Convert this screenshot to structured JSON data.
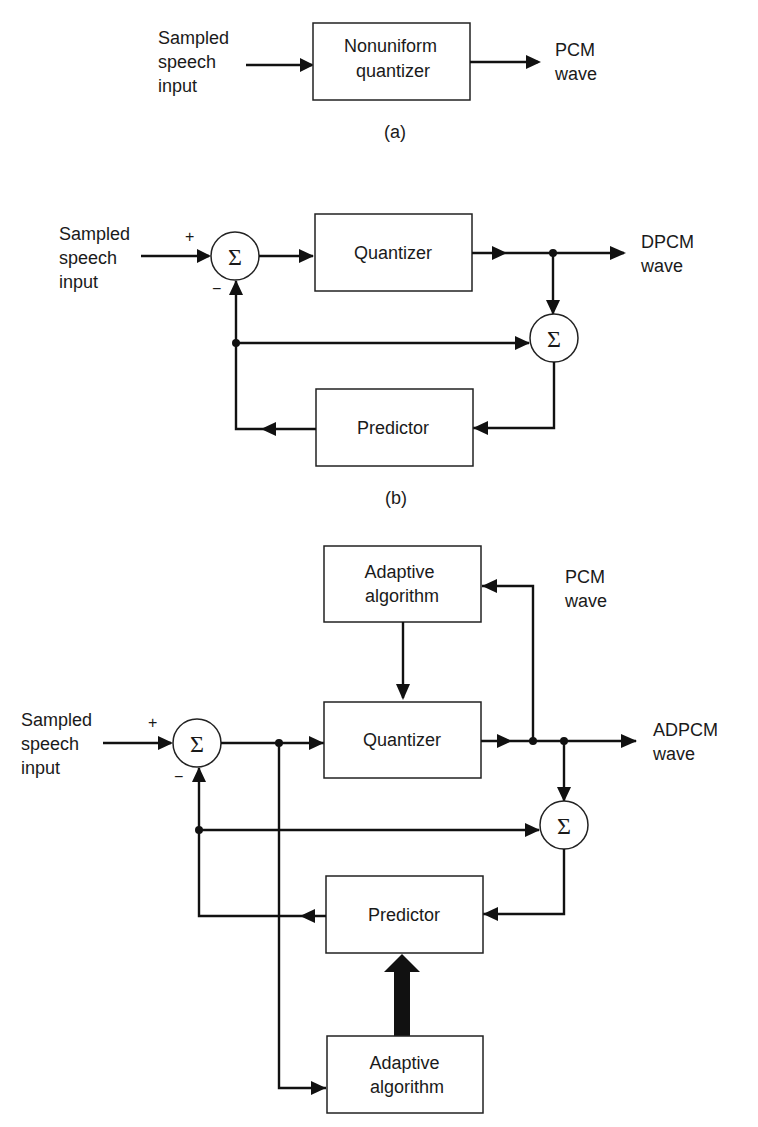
{
  "diagram_a": {
    "caption": "(a)",
    "input_label": [
      "Sampled",
      "speech",
      "input"
    ],
    "quantizer_label": [
      "Nonuniform",
      "quantizer"
    ],
    "output_label": [
      "PCM",
      "wave"
    ]
  },
  "diagram_b": {
    "caption": "(b)",
    "input_label": [
      "Sampled",
      "speech",
      "input"
    ],
    "plus_sign": "+",
    "minus_sign": "−",
    "summer_symbol": "Σ",
    "quantizer_label": "Quantizer",
    "predictor_label": "Predictor",
    "output_label": [
      "DPCM",
      "wave"
    ]
  },
  "diagram_c": {
    "input_label": [
      "Sampled",
      "speech",
      "input"
    ],
    "plus_sign": "+",
    "minus_sign": "−",
    "summer_symbol": "Σ",
    "quantizer_label": "Quantizer",
    "predictor_label": "Predictor",
    "adaptive_top_label": [
      "Adaptive",
      "algorithm"
    ],
    "adaptive_bottom_label": [
      "Adaptive",
      "algorithm"
    ],
    "pcm_label": [
      "PCM",
      "wave"
    ],
    "output_label": [
      "ADPCM",
      "wave"
    ]
  }
}
